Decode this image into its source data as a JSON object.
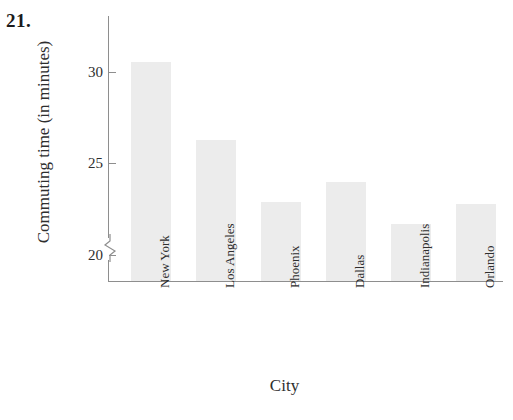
{
  "problem": {
    "number": "21."
  },
  "chart_data": {
    "type": "bar",
    "title": "",
    "subtitle": "",
    "xlabel": "City",
    "ylabel": "Commuting time (in minutes)",
    "categories": [
      "New York",
      "Los Angeles",
      "Phoenix",
      "Dallas",
      "Indianapolis",
      "Orlando"
    ],
    "values": [
      30.5,
      26.3,
      22.9,
      24.0,
      21.7,
      22.8
    ],
    "series": [
      {
        "name": "Commuting time",
        "values": [
          30.5,
          26.3,
          22.9,
          24.0,
          21.7,
          22.8
        ]
      }
    ],
    "ytick_labels": [
      "20",
      "25",
      "30"
    ],
    "ytick_values": [
      20,
      25,
      30
    ],
    "ylim": [
      18.6,
      31.5
    ],
    "axis_break": true,
    "axis_break_below": 20,
    "grid": false,
    "legend": false,
    "legend_position": "none",
    "bar_color": "#ececec",
    "axis_color": "#8e8e8e",
    "text_color": "#2e2e2e"
  }
}
